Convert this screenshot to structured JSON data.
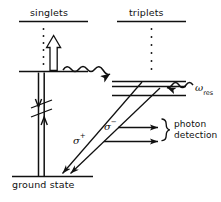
{
  "figure": {
    "kind": "energy-level-diagram",
    "width": 221,
    "height": 202,
    "background": "#ffffff",
    "ink": "#101010"
  },
  "labels": {
    "singlets": "singlets",
    "triplets": "triplets",
    "ground_state": "ground state",
    "omega_res_base": "ω",
    "omega_res_sub": "res",
    "sigma_plus_base": "σ",
    "sigma_plus_sup": "+",
    "sigma_minus_base": "σ",
    "sigma_minus_sup": "−",
    "photon": "photon",
    "detection": "detection"
  },
  "levels": {
    "singlet_manifold_top_rule": "singlet manifold top bar",
    "singlet_excited": "singlet excited level",
    "triplet_manifold_top_rule": "triplet manifold top bar",
    "triplet_upper": "triplet upper sublevel",
    "triplet_middle": "triplet middle sublevel",
    "triplet_lower": "triplet lower sublevel",
    "ground": "ground state level"
  },
  "transitions": {
    "pump": "hollow up arrow pumping from ground manifold to singlet level",
    "singlet_down": "downward straight arrow on singlet side",
    "singlet_up": "upward straight arrow on singlet side",
    "break_marks": "double slash break marks on singlet verticals",
    "intersystem_crossing": "wavy arrow from singlet level to triplet levels",
    "omega_res_drive": "wavy arrow labelled omega res driving triplet sublevels",
    "sigma_plus_decay": "diagonal sigma+ decay arrow to ground state",
    "sigma_minus_decay": "diagonal sigma- decay arrow to ground state",
    "detect_upper": "horizontal detection arrow upper",
    "detect_lower": "horizontal detection arrow lower",
    "brace": "curly brace grouping detection arrows"
  },
  "dots": {
    "singlet_column_count": 6,
    "triplet_column_count": 6
  }
}
